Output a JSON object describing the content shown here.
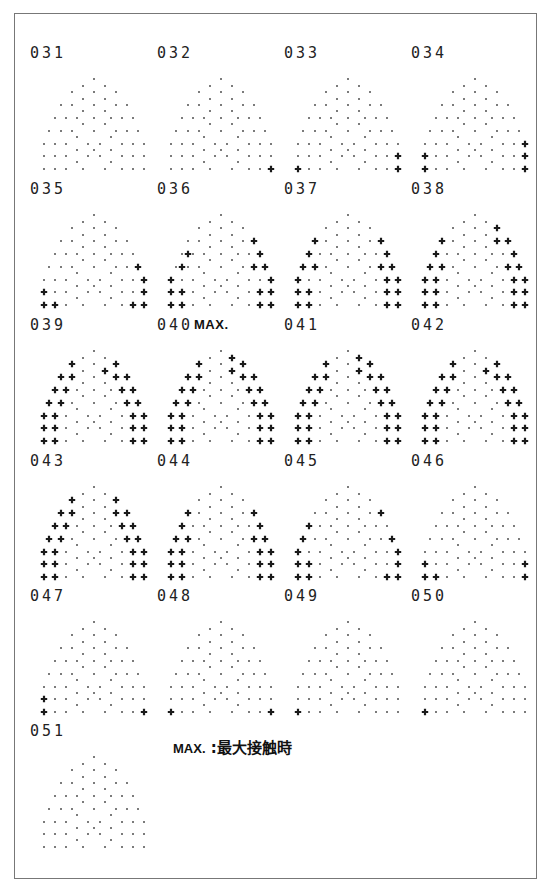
{
  "figure": {
    "legend_key": "MAX.",
    "legend_sep": " :",
    "legend_text": "最大接触時",
    "max_tag": "MAX.",
    "max_cell": "040"
  },
  "grid_layout": {
    "columns": 4,
    "col_x": [
      30,
      157,
      284,
      411
    ],
    "row_y": [
      44,
      180,
      316,
      452,
      587,
      722
    ]
  },
  "base_dots": [
    [
      56,
      5
    ],
    [
      45,
      12
    ],
    [
      67,
      12
    ],
    [
      34,
      18
    ],
    [
      56,
      18
    ],
    [
      78,
      18
    ],
    [
      45,
      25
    ],
    [
      67,
      25
    ],
    [
      23,
      31
    ],
    [
      34,
      31
    ],
    [
      56,
      31
    ],
    [
      78,
      31
    ],
    [
      89,
      31
    ],
    [
      45,
      37
    ],
    [
      67,
      37
    ],
    [
      17,
      44
    ],
    [
      28,
      44
    ],
    [
      39,
      44
    ],
    [
      56,
      44
    ],
    [
      73,
      44
    ],
    [
      84,
      44
    ],
    [
      95,
      44
    ],
    [
      45,
      50
    ],
    [
      67,
      50
    ],
    [
      11,
      57
    ],
    [
      23,
      57
    ],
    [
      34,
      57
    ],
    [
      56,
      57
    ],
    [
      78,
      57
    ],
    [
      89,
      57
    ],
    [
      100,
      57
    ],
    [
      39,
      63
    ],
    [
      73,
      63
    ],
    [
      6,
      70
    ],
    [
      17,
      70
    ],
    [
      28,
      70
    ],
    [
      50,
      70
    ],
    [
      62,
      70
    ],
    [
      84,
      70
    ],
    [
      95,
      70
    ],
    [
      106,
      70
    ],
    [
      39,
      76
    ],
    [
      56,
      76
    ],
    [
      73,
      76
    ],
    [
      6,
      82
    ],
    [
      17,
      82
    ],
    [
      28,
      82
    ],
    [
      50,
      82
    ],
    [
      62,
      82
    ],
    [
      84,
      82
    ],
    [
      95,
      82
    ],
    [
      106,
      82
    ],
    [
      39,
      88
    ],
    [
      73,
      88
    ],
    [
      6,
      95
    ],
    [
      17,
      95
    ],
    [
      28,
      95
    ],
    [
      45,
      95
    ],
    [
      67,
      95
    ],
    [
      84,
      95
    ],
    [
      95,
      95
    ],
    [
      106,
      95
    ]
  ],
  "cells": [
    {
      "id": "031",
      "crosses": []
    },
    {
      "id": "032",
      "crosses": [
        [
          106,
          95
        ]
      ]
    },
    {
      "id": "033",
      "crosses": [
        [
          6,
          95
        ],
        [
          106,
          82
        ],
        [
          106,
          95
        ]
      ]
    },
    {
      "id": "034",
      "crosses": [
        [
          6,
          82
        ],
        [
          6,
          95
        ],
        [
          106,
          70
        ],
        [
          106,
          82
        ],
        [
          106,
          95
        ]
      ]
    },
    {
      "id": "035",
      "crosses": [
        [
          6,
          82
        ],
        [
          6,
          95
        ],
        [
          17,
          95
        ],
        [
          100,
          57
        ],
        [
          106,
          70
        ],
        [
          106,
          82
        ],
        [
          95,
          95
        ],
        [
          106,
          95
        ]
      ]
    },
    {
      "id": "036",
      "crosses": [
        [
          89,
          31
        ],
        [
          23,
          44
        ],
        [
          95,
          44
        ],
        [
          17,
          57
        ],
        [
          89,
          57
        ],
        [
          100,
          57
        ],
        [
          6,
          70
        ],
        [
          106,
          70
        ],
        [
          6,
          82
        ],
        [
          17,
          82
        ],
        [
          95,
          82
        ],
        [
          106,
          82
        ],
        [
          6,
          95
        ],
        [
          17,
          95
        ],
        [
          95,
          95
        ],
        [
          106,
          95
        ]
      ]
    },
    {
      "id": "037",
      "crosses": [
        [
          23,
          31
        ],
        [
          89,
          31
        ],
        [
          17,
          44
        ],
        [
          95,
          44
        ],
        [
          11,
          57
        ],
        [
          23,
          57
        ],
        [
          89,
          57
        ],
        [
          100,
          57
        ],
        [
          6,
          70
        ],
        [
          95,
          70
        ],
        [
          106,
          70
        ],
        [
          6,
          82
        ],
        [
          17,
          82
        ],
        [
          95,
          82
        ],
        [
          106,
          82
        ],
        [
          6,
          95
        ],
        [
          17,
          95
        ],
        [
          95,
          95
        ],
        [
          106,
          95
        ]
      ]
    },
    {
      "id": "038",
      "crosses": [
        [
          78,
          18
        ],
        [
          23,
          31
        ],
        [
          78,
          31
        ],
        [
          89,
          31
        ],
        [
          17,
          44
        ],
        [
          95,
          44
        ],
        [
          11,
          57
        ],
        [
          23,
          57
        ],
        [
          89,
          57
        ],
        [
          100,
          57
        ],
        [
          6,
          70
        ],
        [
          17,
          70
        ],
        [
          95,
          70
        ],
        [
          106,
          70
        ],
        [
          6,
          82
        ],
        [
          17,
          82
        ],
        [
          95,
          82
        ],
        [
          106,
          82
        ],
        [
          6,
          95
        ],
        [
          17,
          95
        ],
        [
          95,
          95
        ],
        [
          106,
          95
        ]
      ]
    },
    {
      "id": "039",
      "crosses": [
        [
          34,
          18
        ],
        [
          67,
          25
        ],
        [
          78,
          18
        ],
        [
          23,
          31
        ],
        [
          34,
          31
        ],
        [
          78,
          31
        ],
        [
          89,
          31
        ],
        [
          17,
          44
        ],
        [
          28,
          44
        ],
        [
          84,
          44
        ],
        [
          95,
          44
        ],
        [
          11,
          57
        ],
        [
          23,
          57
        ],
        [
          89,
          57
        ],
        [
          100,
          57
        ],
        [
          6,
          70
        ],
        [
          17,
          70
        ],
        [
          95,
          70
        ],
        [
          106,
          70
        ],
        [
          6,
          82
        ],
        [
          17,
          82
        ],
        [
          95,
          82
        ],
        [
          106,
          82
        ],
        [
          6,
          95
        ],
        [
          17,
          95
        ],
        [
          95,
          95
        ],
        [
          106,
          95
        ]
      ]
    },
    {
      "id": "040",
      "crosses": [
        [
          34,
          18
        ],
        [
          67,
          12
        ],
        [
          78,
          18
        ],
        [
          67,
          25
        ],
        [
          23,
          31
        ],
        [
          34,
          31
        ],
        [
          78,
          31
        ],
        [
          89,
          31
        ],
        [
          17,
          44
        ],
        [
          28,
          44
        ],
        [
          84,
          44
        ],
        [
          95,
          44
        ],
        [
          11,
          57
        ],
        [
          23,
          57
        ],
        [
          89,
          57
        ],
        [
          100,
          57
        ],
        [
          6,
          70
        ],
        [
          17,
          70
        ],
        [
          95,
          70
        ],
        [
          106,
          70
        ],
        [
          6,
          82
        ],
        [
          17,
          82
        ],
        [
          95,
          82
        ],
        [
          106,
          82
        ],
        [
          6,
          95
        ],
        [
          17,
          95
        ],
        [
          95,
          95
        ],
        [
          106,
          95
        ]
      ]
    },
    {
      "id": "041",
      "crosses": [
        [
          34,
          18
        ],
        [
          67,
          12
        ],
        [
          78,
          18
        ],
        [
          67,
          25
        ],
        [
          23,
          31
        ],
        [
          34,
          31
        ],
        [
          78,
          31
        ],
        [
          89,
          31
        ],
        [
          17,
          44
        ],
        [
          28,
          44
        ],
        [
          84,
          44
        ],
        [
          95,
          44
        ],
        [
          11,
          57
        ],
        [
          23,
          57
        ],
        [
          89,
          57
        ],
        [
          100,
          57
        ],
        [
          6,
          70
        ],
        [
          17,
          70
        ],
        [
          95,
          70
        ],
        [
          106,
          70
        ],
        [
          6,
          82
        ],
        [
          17,
          82
        ],
        [
          95,
          82
        ],
        [
          106,
          82
        ],
        [
          6,
          95
        ],
        [
          17,
          95
        ],
        [
          95,
          95
        ],
        [
          106,
          95
        ]
      ]
    },
    {
      "id": "042",
      "crosses": [
        [
          34,
          18
        ],
        [
          67,
          25
        ],
        [
          78,
          18
        ],
        [
          23,
          31
        ],
        [
          34,
          31
        ],
        [
          78,
          31
        ],
        [
          89,
          31
        ],
        [
          17,
          44
        ],
        [
          28,
          44
        ],
        [
          84,
          44
        ],
        [
          95,
          44
        ],
        [
          11,
          57
        ],
        [
          23,
          57
        ],
        [
          89,
          57
        ],
        [
          100,
          57
        ],
        [
          6,
          70
        ],
        [
          17,
          70
        ],
        [
          95,
          70
        ],
        [
          106,
          70
        ],
        [
          6,
          82
        ],
        [
          17,
          82
        ],
        [
          95,
          82
        ],
        [
          106,
          82
        ],
        [
          6,
          95
        ],
        [
          17,
          95
        ],
        [
          95,
          95
        ],
        [
          106,
          95
        ]
      ]
    },
    {
      "id": "043",
      "crosses": [
        [
          34,
          18
        ],
        [
          78,
          18
        ],
        [
          23,
          31
        ],
        [
          34,
          31
        ],
        [
          78,
          31
        ],
        [
          89,
          31
        ],
        [
          17,
          44
        ],
        [
          28,
          44
        ],
        [
          84,
          44
        ],
        [
          95,
          44
        ],
        [
          11,
          57
        ],
        [
          23,
          57
        ],
        [
          89,
          57
        ],
        [
          100,
          57
        ],
        [
          6,
          70
        ],
        [
          17,
          70
        ],
        [
          95,
          70
        ],
        [
          106,
          70
        ],
        [
          6,
          82
        ],
        [
          17,
          82
        ],
        [
          95,
          82
        ],
        [
          106,
          82
        ],
        [
          6,
          95
        ],
        [
          17,
          95
        ],
        [
          95,
          95
        ],
        [
          106,
          95
        ]
      ]
    },
    {
      "id": "044",
      "crosses": [
        [
          23,
          31
        ],
        [
          89,
          31
        ],
        [
          17,
          44
        ],
        [
          95,
          44
        ],
        [
          11,
          57
        ],
        [
          23,
          57
        ],
        [
          89,
          57
        ],
        [
          100,
          57
        ],
        [
          6,
          70
        ],
        [
          17,
          70
        ],
        [
          95,
          70
        ],
        [
          106,
          70
        ],
        [
          6,
          82
        ],
        [
          17,
          82
        ],
        [
          95,
          82
        ],
        [
          106,
          82
        ],
        [
          6,
          95
        ],
        [
          17,
          95
        ],
        [
          95,
          95
        ],
        [
          106,
          95
        ]
      ]
    },
    {
      "id": "045",
      "crosses": [
        [
          89,
          31
        ],
        [
          17,
          44
        ],
        [
          11,
          57
        ],
        [
          100,
          57
        ],
        [
          6,
          70
        ],
        [
          106,
          70
        ],
        [
          6,
          82
        ],
        [
          17,
          82
        ],
        [
          106,
          82
        ],
        [
          6,
          95
        ],
        [
          17,
          95
        ],
        [
          95,
          95
        ],
        [
          106,
          95
        ]
      ]
    },
    {
      "id": "046",
      "crosses": [
        [
          6,
          82
        ],
        [
          106,
          82
        ],
        [
          6,
          95
        ],
        [
          17,
          95
        ],
        [
          106,
          95
        ]
      ]
    },
    {
      "id": "047",
      "crosses": [
        [
          6,
          82
        ],
        [
          6,
          95
        ],
        [
          106,
          95
        ]
      ]
    },
    {
      "id": "048",
      "crosses": [
        [
          6,
          95
        ],
        [
          106,
          95
        ]
      ]
    },
    {
      "id": "049",
      "crosses": [
        [
          6,
          95
        ]
      ]
    },
    {
      "id": "050",
      "crosses": [
        [
          6,
          95
        ]
      ]
    },
    {
      "id": "051",
      "crosses": []
    }
  ],
  "colors": {
    "dot": "#333333",
    "cross": "#1a1a1a",
    "border": "#777777",
    "background": "#ffffff"
  }
}
